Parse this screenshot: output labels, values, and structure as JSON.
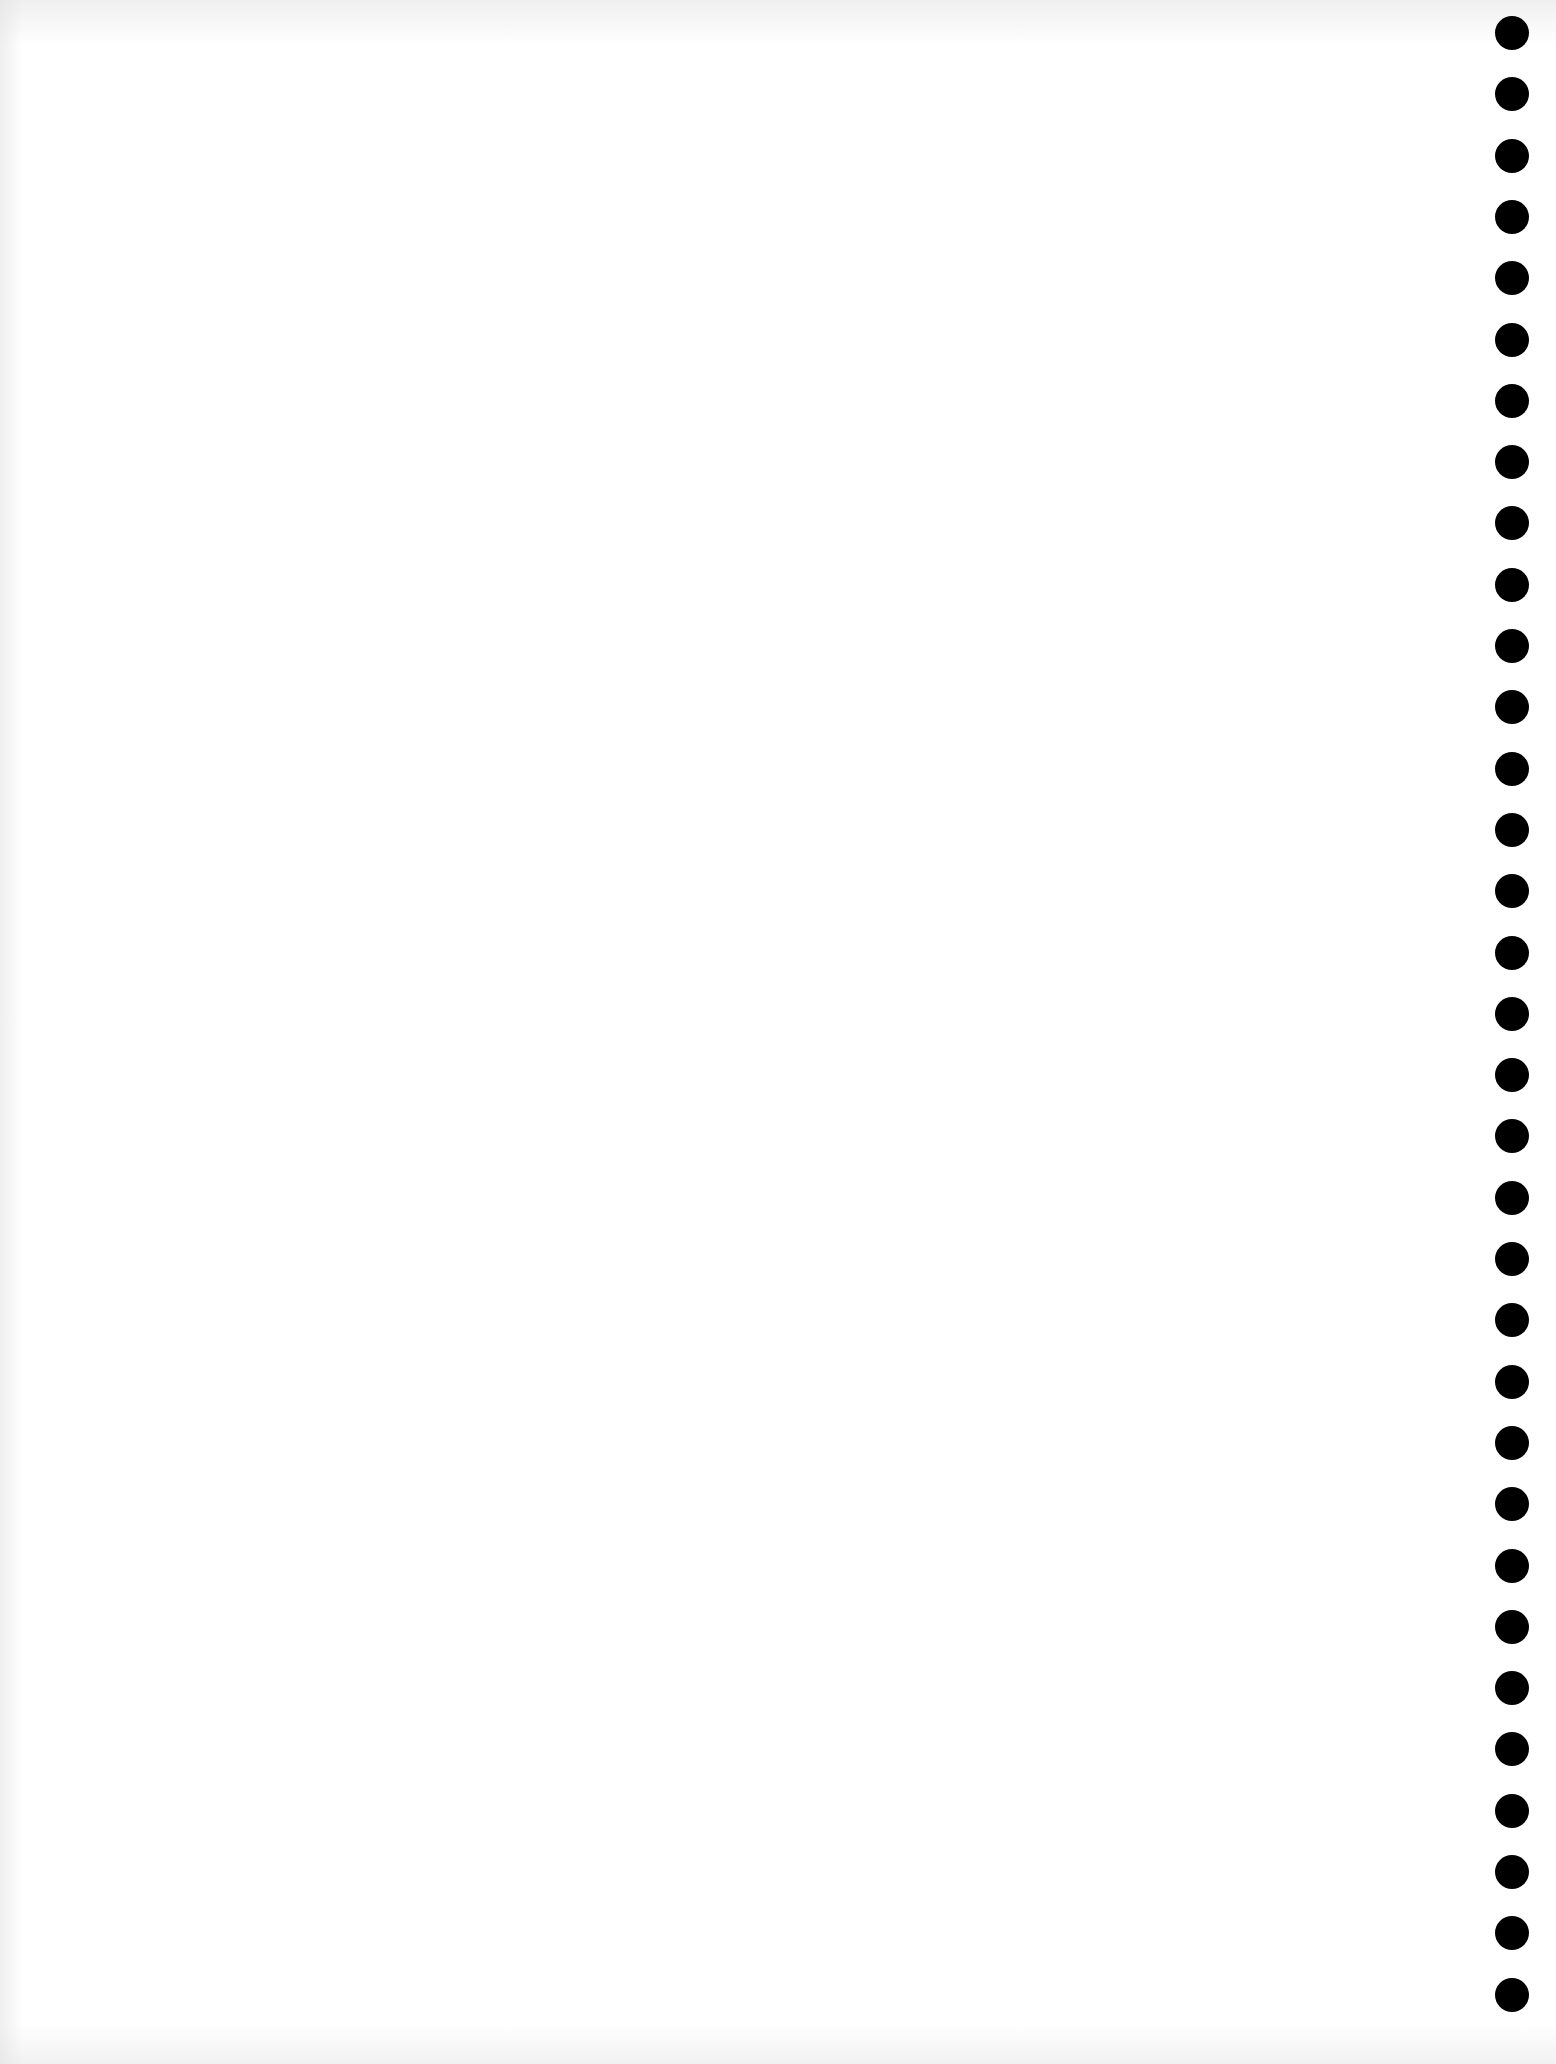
{
  "page": {
    "type": "blank scanned sheet",
    "background_color": "#ffffff",
    "text": ""
  },
  "punch_holes": {
    "count": 33,
    "color": "#000000",
    "side": "right",
    "first_center_y": 33,
    "spacing_px": 61.3,
    "diameter_px": 34
  }
}
